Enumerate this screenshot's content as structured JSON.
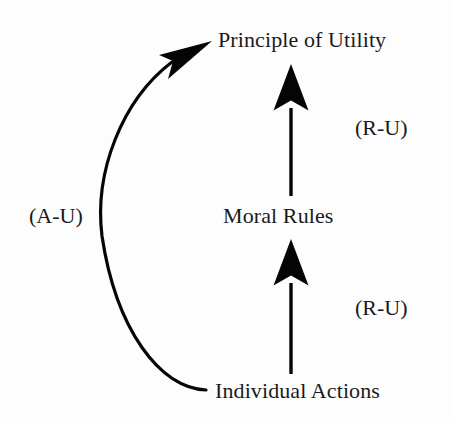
{
  "diagram": {
    "background_color": "#fdfdfd",
    "ink_color": "#000000",
    "nodes": [
      {
        "id": "principle",
        "label": "Principle of Utility",
        "position": "top"
      },
      {
        "id": "moral",
        "label": "Moral Rules",
        "position": "middle"
      },
      {
        "id": "individual",
        "label": "Individual Actions",
        "position": "bottom"
      }
    ],
    "edges": [
      {
        "id": "moral-to-principle",
        "from": "moral",
        "to": "principle",
        "label": "(R-U)",
        "style": "straight",
        "direction": "up"
      },
      {
        "id": "individual-to-moral",
        "from": "individual",
        "to": "moral",
        "label": "(R-U)",
        "style": "straight",
        "direction": "up"
      },
      {
        "id": "individual-to-principle",
        "from": "individual",
        "to": "principle",
        "label": "(A-U)",
        "style": "curved",
        "direction": "up"
      }
    ],
    "labels": {
      "act_utilitarianism": "(A-U)",
      "rule_utilitarianism_upper": "(R-U)",
      "rule_utilitarianism_lower": "(R-U)"
    }
  }
}
